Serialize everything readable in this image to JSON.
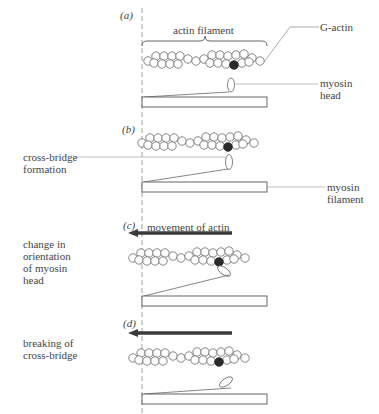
{
  "figure": {
    "panels": [
      {
        "id": "a",
        "label": "(a)"
      },
      {
        "id": "b",
        "label": "(b)"
      },
      {
        "id": "c",
        "label": "(c)"
      },
      {
        "id": "d",
        "label": "(d)"
      }
    ],
    "labels": {
      "actin_filament": "actin filament",
      "g_actin": "G-actin",
      "myosin_head": "myosin\nhead",
      "cross_bridge_formation": "cross-bridge\nformation",
      "myosin_filament": "myosin\nfilament",
      "movement_of_actin": "movement of actin",
      "change_orientation": "change in\norientation\nof myosin\nhead",
      "breaking_cross_bridge": "breaking of\ncross-bridge"
    },
    "colors": {
      "line": "#555555",
      "dark_actin": "#2a2a2a",
      "arrow": "#3a3a3a"
    }
  }
}
